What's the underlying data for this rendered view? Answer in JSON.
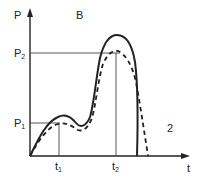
{
  "diagram": {
    "region_label": "B",
    "region_label_2": "2",
    "y_axis_label": "P",
    "x_axis_label": "t",
    "levels": [
      {
        "base": "P",
        "sub": "1"
      },
      {
        "base": "P",
        "sub": "2"
      }
    ],
    "times": [
      {
        "base": "t",
        "sub": "1"
      },
      {
        "base": "t",
        "sub": "2"
      }
    ],
    "curves": [
      {
        "name": "solid-curve",
        "style": "solid"
      },
      {
        "name": "dashed-curve",
        "style": "dashed"
      }
    ],
    "colors": {
      "line": "#222222",
      "guide": "#444444",
      "background": "#ffffff"
    }
  }
}
